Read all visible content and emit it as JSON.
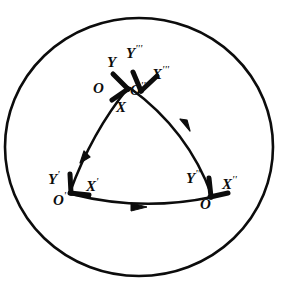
{
  "figure": {
    "background_color": "#ffffff",
    "ink_color": "#0c0c0c",
    "boundary": {
      "name": "great-circle-boundary",
      "shape": "circle",
      "center_x": 139,
      "center_y": 147,
      "radius_x": 134,
      "radius_y": 129,
      "stroke_width": 2.6
    },
    "vertices": [
      {
        "id": "apex",
        "x": 128,
        "y": 88,
        "label_group": [
          "O",
          "X",
          "Y",
          "O'''",
          "X'''",
          "Y'''"
        ]
      },
      {
        "id": "lower-left",
        "x": 70,
        "y": 192,
        "label_group": [
          "O'",
          "X'",
          "Y'"
        ]
      },
      {
        "id": "lower-right",
        "x": 212,
        "y": 196,
        "label_group": [
          "O''",
          "X''",
          "Y''"
        ]
      }
    ],
    "arcs": [
      {
        "name": "arc-apex-to-lower-left",
        "from": "apex",
        "to": "lower-left",
        "arrow_direction": "down-left",
        "arrow_t": 0.52
      },
      {
        "name": "arc-lower-left-to-lower-right",
        "from": "lower-left",
        "to": "lower-right",
        "arrow_direction": "right",
        "arrow_t": 0.45
      },
      {
        "name": "arc-lower-right-to-apex",
        "from": "lower-right",
        "to": "apex",
        "arrow_direction": "up-left",
        "arrow_t": 0.52
      }
    ],
    "labels": [
      {
        "id": "label-O",
        "base": "O",
        "primes": "",
        "x": 93,
        "y": 88,
        "size": "sz-md"
      },
      {
        "id": "label-X",
        "base": "X",
        "primes": "",
        "x": 116,
        "y": 107,
        "size": "sz-md"
      },
      {
        "id": "label-Y",
        "base": "Y",
        "primes": "",
        "x": 107,
        "y": 62,
        "size": "sz-md"
      },
      {
        "id": "label-O3",
        "base": "O",
        "primes": "'''",
        "x": 128,
        "y": 88,
        "size": "sz-md"
      },
      {
        "id": "label-X3",
        "base": "X",
        "primes": "'''",
        "x": 152,
        "y": 73,
        "size": "sz-md"
      },
      {
        "id": "label-Y3",
        "base": "Y",
        "primes": "'''",
        "x": 126,
        "y": 53,
        "size": "sz-md"
      },
      {
        "id": "label-O1",
        "base": "O",
        "primes": "'",
        "x": 55,
        "y": 199,
        "size": "sz-md"
      },
      {
        "id": "label-X1",
        "base": "X",
        "primes": "'",
        "x": 85,
        "y": 186,
        "size": "sz-md"
      },
      {
        "id": "label-Y1",
        "base": "Y",
        "primes": "'",
        "x": 50,
        "y": 179,
        "size": "sz-md"
      },
      {
        "id": "label-O2",
        "base": "O",
        "primes": "''",
        "x": 201,
        "y": 203,
        "size": "sz-md"
      },
      {
        "id": "label-X2",
        "base": "X",
        "primes": "''",
        "x": 222,
        "y": 184,
        "size": "sz-md"
      },
      {
        "id": "label-Y2",
        "base": "Y",
        "primes": "''",
        "x": 187,
        "y": 178,
        "size": "sz-md"
      }
    ]
  }
}
